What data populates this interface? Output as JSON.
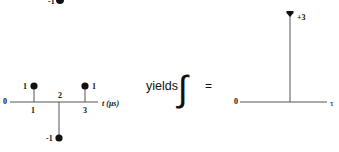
{
  "left_plot": {
    "origin_label": "0",
    "axis_label": "t (μs)",
    "top_partial": {
      "label": "-1"
    },
    "impulses": [
      {
        "t": 1,
        "value": 1,
        "value_label": "1",
        "tick_label": "1"
      },
      {
        "t": 2,
        "value": -1,
        "value_label": "-1",
        "tick_label": "2"
      },
      {
        "t": 3,
        "value": 1,
        "value_label": "1",
        "tick_label": "3"
      }
    ]
  },
  "operator": {
    "word": "yields",
    "symbol": "∫",
    "equals": "="
  },
  "right_plot": {
    "origin_label": "0",
    "axis_label": "τ",
    "impulse": {
      "value": 3,
      "value_label": "+3"
    }
  },
  "colors": {
    "ink": "#111111",
    "axis": "#555555",
    "background": "#ffffff"
  }
}
